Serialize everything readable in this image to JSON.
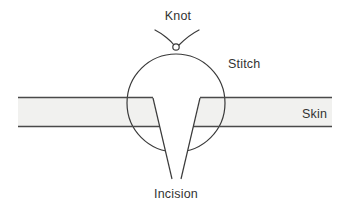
{
  "diagram": {
    "labels": {
      "knot": "Knot",
      "stitch": "Stitch",
      "skin": "Skin",
      "incision": "Incision"
    },
    "colors": {
      "line": "#3a3a3a",
      "skin_border": "#4a4a4a",
      "skin_fill": "#f1f1ef",
      "text": "#333333",
      "background": "#ffffff"
    },
    "geometry": {
      "canvas": {
        "width": 349,
        "height": 211
      },
      "skin_band": {
        "x_left": 18,
        "x_right": 332,
        "y_top": 98,
        "y_bottom": 126
      },
      "stitch_circle": {
        "cx": 176,
        "cy": 103,
        "r": 49
      },
      "knot": {
        "cx": 176,
        "cy": 47,
        "r": 3
      },
      "incision_wedge": {
        "top_left_x": 153,
        "top_right_x": 200,
        "top_y": 98,
        "bottom_left_x": 172,
        "bottom_right_x": 181,
        "bottom_y": 179
      }
    },
    "label_positions": {
      "knot": {
        "x": 178,
        "y": 20
      },
      "stitch": {
        "x": 228,
        "y": 68
      },
      "skin": {
        "x": 302,
        "y": 118
      },
      "incision": {
        "x": 176,
        "y": 198
      }
    }
  }
}
